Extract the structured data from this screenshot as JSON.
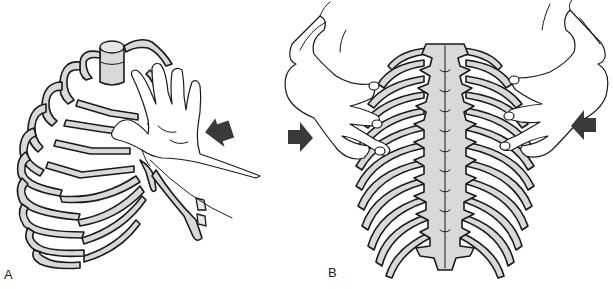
{
  "figure": {
    "panels": [
      {
        "id": "A",
        "label": "A",
        "description": "Anterior-lateral view of rib cage with hand pressing on upper ribs; compression arrow from right"
      },
      {
        "id": "B",
        "label": "B",
        "description": "Posterior view of thoracic spine and rib cage with two hands gripping ribs; compression arrows from both sides"
      }
    ],
    "arrows": [
      {
        "panel": "A",
        "direction": "left-up",
        "color": "#3a3a3a"
      },
      {
        "panel": "B",
        "direction": "right",
        "color": "#3a3a3a"
      },
      {
        "panel": "B",
        "direction": "left",
        "color": "#3a3a3a"
      }
    ],
    "colors": {
      "bone_fill": "#d9d9d9",
      "outline": "#1a1a1a",
      "background": "#ffffff",
      "arrow": "#3a3a3a"
    }
  }
}
